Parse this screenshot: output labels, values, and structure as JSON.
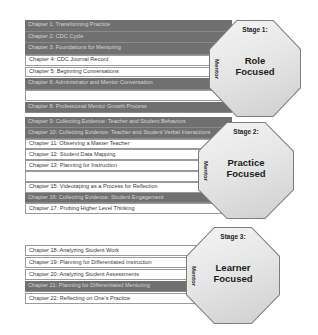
{
  "stages": [
    {
      "stage_label": "Stage 1:",
      "focus_line1": "Role",
      "focus_line2": "Focused",
      "side_label": "Mentor",
      "chapters": [
        {
          "label": "Chapter 1: Transforming Practice",
          "style": "dark"
        },
        {
          "label": "Chapter 2: CDC Cycle",
          "style": "dark"
        },
        {
          "label": "Chapter 3: Foundations for Mentoring",
          "style": "dark"
        },
        {
          "label": "Chapter 4: CDC Journal  Record",
          "style": "light"
        },
        {
          "label": "Chapter 5: Beginning Conversations",
          "style": "light"
        },
        {
          "label": "Chapter 6: Administrator and Mentor Conversation",
          "style": "dark"
        },
        {
          "label": "",
          "style": "light"
        },
        {
          "label": "Chapter 8: Professional Mentor Growth Process",
          "style": "dark"
        }
      ]
    },
    {
      "stage_label": "Stage 2:",
      "focus_line1": "Practice",
      "focus_line2": "Focused",
      "side_label": "Mentor",
      "chapters": [
        {
          "label": "Chapter 9: Collecting Evidence: Teacher and Student Behaviors",
          "style": "dark"
        },
        {
          "label": "Chapter 10: Collecting Evidence: Teacher and Student Verbal Interactions",
          "style": "dark"
        },
        {
          "label": "Chapter 11: Observing a Master Teacher",
          "style": "light"
        },
        {
          "label": "Chapter 12: Student Data Mapping",
          "style": "light"
        },
        {
          "label": "Chapter 13: Planning for Instruction",
          "style": "light"
        },
        {
          "label": "",
          "style": "light"
        },
        {
          "label": "Chapter 15: Videotaping as a Process for Reflection",
          "style": "light"
        },
        {
          "label": "Chapter 16: Collecting Evidence: Student Engagement",
          "style": "dark"
        },
        {
          "label": "Chapter 17: Probing Higher Level Thinking",
          "style": "light"
        }
      ]
    },
    {
      "stage_label": "Stage 3:",
      "focus_line1": "Learner",
      "focus_line2": "Focused",
      "side_label": "Mentor",
      "chapters": [
        {
          "label": "Chapter 18: Analyzing Student Work",
          "style": "light"
        },
        {
          "label": "Chapter 19: Planning for Differentiated Instruction",
          "style": "light"
        },
        {
          "label": "Chapter 20: Analyzing Student Assessments",
          "style": "light"
        },
        {
          "label": "Chapter 21: Planning for Differentiated Mentoring",
          "style": "dark"
        },
        {
          "label": "Chapter 22: Reflecting on One's Practice",
          "style": "light"
        }
      ]
    }
  ],
  "colors": {
    "dark_row": "#707070",
    "light_row": "#ffffff",
    "octagon_fill": "#e6e6e6"
  }
}
